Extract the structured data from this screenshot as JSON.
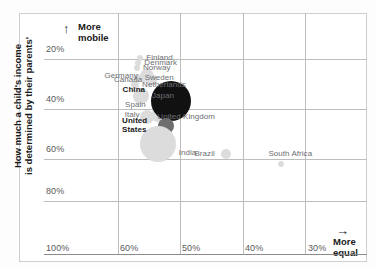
{
  "chart_data": {
    "type": "scatter",
    "title": "",
    "xlabel": "More equal",
    "ylabel": "How much a child's income is determined by their parents'",
    "y_axis_note_top": "More mobile",
    "y_axis_note_lines": [
      "More",
      "mobile"
    ],
    "x_axis_note_lines": [
      "More",
      "equal"
    ],
    "x_arrow": "→",
    "y_arrow": "↑",
    "xticks": [
      "100%",
      "60%",
      "50%",
      "40%",
      "30%"
    ],
    "yticks": [
      "20%",
      "40%",
      "60%",
      "80%"
    ],
    "xlim_note": "inequality, decreasing left to right",
    "ylim_note": "intergenerational income elasticity, 20% top to 80%+ bottom",
    "grid": true,
    "legend": "none",
    "bubble_note": "bubble area scales with population",
    "points": [
      {
        "label": "Finland",
        "x": 0.298,
        "y": 0.185,
        "size": 3,
        "shade": "light",
        "label_dx": 0,
        "label_dy": -6
      },
      {
        "label": "Denmark",
        "x": 0.292,
        "y": 0.207,
        "size": 3,
        "shade": "light",
        "label_dx": 0,
        "label_dy": -6
      },
      {
        "label": "Norway",
        "x": 0.288,
        "y": 0.23,
        "size": 3,
        "shade": "light",
        "label_dx": 0,
        "label_dy": -6
      },
      {
        "label": "Sweden",
        "x": 0.29,
        "y": 0.268,
        "size": 4,
        "shade": "light",
        "label_dx": 0,
        "label_dy": -6
      },
      {
        "label": "Netherlands",
        "x": 0.282,
        "y": 0.3,
        "size": 4,
        "shade": "light",
        "label_dx": 0,
        "label_dy": -6
      },
      {
        "label": "Germany",
        "x": 0.318,
        "y": 0.262,
        "size": 7,
        "shade": "light",
        "label_dx": 0,
        "label_dy": -6
      },
      {
        "label": "Canada",
        "x": 0.33,
        "y": 0.28,
        "size": 6,
        "shade": "light",
        "label_dx": 0,
        "label_dy": -6
      },
      {
        "label": "Japan",
        "x": 0.3,
        "y": 0.345,
        "size": 8,
        "shade": "light",
        "label_dx": 0,
        "label_dy": -6
      },
      {
        "label": "Spain",
        "x": 0.35,
        "y": 0.382,
        "size": 6,
        "shade": "light",
        "label_dx": 0,
        "label_dy": -6
      },
      {
        "label": "Italy",
        "x": 0.352,
        "y": 0.425,
        "size": 7,
        "shade": "light",
        "label_dx": 0,
        "label_dy": -6
      },
      {
        "label": "United Kingdom",
        "x": 0.32,
        "y": 0.43,
        "size": 7,
        "shade": "light",
        "label_dx": 0,
        "label_dy": -6
      },
      {
        "label": "China",
        "x": 0.392,
        "y": 0.365,
        "size": 20,
        "shade": "dark",
        "label_dx": -24,
        "label_dy": -4
      },
      {
        "label": "United States",
        "x": 0.378,
        "y": 0.47,
        "size": 8,
        "shade": "mid",
        "label_dx": -22,
        "label_dy": -5
      },
      {
        "label": "India",
        "x": 0.352,
        "y": 0.545,
        "size": 18,
        "shade": "light",
        "label_dx": 20,
        "label_dy": 4
      },
      {
        "label": "Brazil",
        "x": 0.565,
        "y": 0.585,
        "size": 5,
        "shade": "light",
        "label_dx": -20,
        "label_dy": -4
      },
      {
        "label": "South Africa",
        "x": 0.735,
        "y": 0.625,
        "size": 3,
        "shade": "light",
        "label_dx": 6,
        "label_dy": -10
      }
    ]
  },
  "axis": {
    "y_note_top": "More",
    "y_note_bottom": "mobile",
    "x_note_top": "More",
    "x_note_bottom": "equal",
    "y_title_line1": "How much a child's income",
    "y_title_line2": "is determined by their parents'",
    "ytick_20": "20%",
    "ytick_40": "40%",
    "ytick_60": "60%",
    "ytick_80": "80%",
    "xtick_100": "100%",
    "xtick_60": "60%",
    "xtick_50": "50%",
    "xtick_40": "40%",
    "xtick_30": "30%"
  },
  "labels": {
    "finland": "Finland",
    "denmark": "Denmark",
    "norway": "Norway",
    "sweden": "Sweden",
    "netherlands": "Netherlands",
    "germany": "Germany",
    "canada": "Canada",
    "japan": "Japan",
    "spain": "Spain",
    "italy": "Italy",
    "united_kingdom": "United Kingdom",
    "china": "China",
    "united_states_l1": "United",
    "united_states_l2": "States",
    "india": "India",
    "brazil": "Brazil",
    "south_africa": "South Africa"
  },
  "colors": {
    "grid": "#bdbdbd",
    "axis": "#8c8c8c",
    "frame": "#cfcfcf",
    "tick_text": "#58595b",
    "country_text": "#6d6e71",
    "highlight_text": "#1a1a1a",
    "bubble_light": "#dcdcdc",
    "bubble_mid": "#6e6e6e",
    "bubble_dark": "#111111"
  }
}
